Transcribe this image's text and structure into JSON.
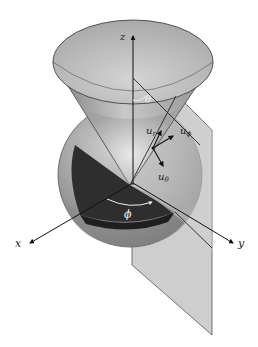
{
  "diagram": {
    "type": "spherical-coordinates",
    "labels": {
      "z": "z",
      "x": "x",
      "y": "y",
      "theta": "θ",
      "phi": "ϕ",
      "u_r": "u",
      "u_r_sub": "r",
      "u_phi": "u",
      "u_phi_sub": "ϕ",
      "u_theta": "u",
      "u_theta_sub": "θ"
    },
    "colors": {
      "background": "#ffffff",
      "cone_light": "#d8d8d8",
      "cone_dark": "#8c8c8c",
      "sphere_light": "#b4b4b4",
      "sphere_dark": "#6e6e6e",
      "wedge": "#2c2c2c",
      "plane": "#c8c8c8",
      "axis": "#111111"
    }
  }
}
